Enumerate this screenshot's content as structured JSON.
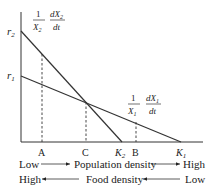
{
  "diagram": {
    "type": "population growth rate vs density",
    "y_axis_labels": {
      "r2": {
        "base": "r",
        "sub": "2"
      },
      "r1": {
        "base": "r",
        "sub": "1"
      }
    },
    "x_axis_labels": {
      "A": "A",
      "C": "C",
      "K2": {
        "base": "K",
        "sub": "2"
      },
      "B": "B",
      "K1": {
        "base": "K",
        "sub": "1"
      }
    },
    "curves": [
      {
        "name": "species-2-per-capita-growth",
        "numerator": "1",
        "denominator": "X",
        "denominator_sub": "2",
        "deriv_num": "dX",
        "deriv_num_sub": "2",
        "deriv_den": "dt"
      },
      {
        "name": "species-1-per-capita-growth",
        "numerator": "1",
        "denominator": "X",
        "denominator_sub": "1",
        "deriv_num": "dX",
        "deriv_num_sub": "1",
        "deriv_den": "dt"
      }
    ],
    "legend_rows": [
      {
        "left": "Low",
        "center": "Population density",
        "right": "High",
        "direction": "right"
      },
      {
        "left": "High",
        "center": "Food density",
        "right": "Low",
        "direction": "left"
      }
    ]
  }
}
